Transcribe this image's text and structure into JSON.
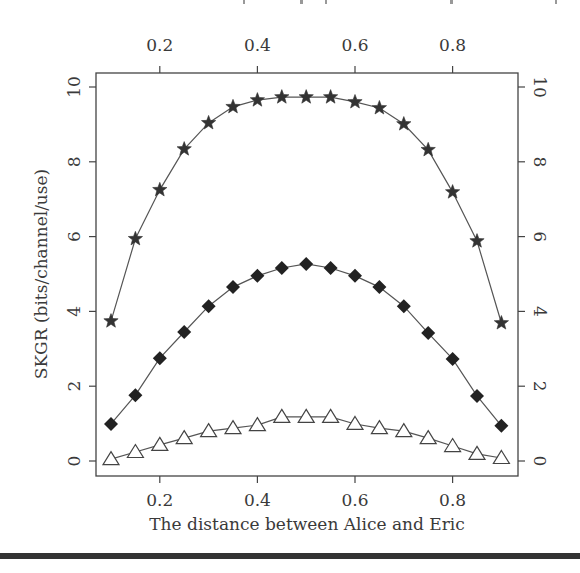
{
  "chart_data": {
    "type": "line",
    "title": "",
    "xlabel": "The distance between Alice and Eric",
    "ylabel": "SKGR (bits/channel/use)",
    "xlim": [
      0.08,
      0.94
    ],
    "ylim": [
      -0.4,
      10.4
    ],
    "x_ticks": [
      0.2,
      0.4,
      0.6,
      0.8
    ],
    "x_tick_labels": [
      "0.2",
      "0.4",
      "0.6",
      "0.8"
    ],
    "y_ticks": [
      0,
      2,
      4,
      6,
      8,
      10
    ],
    "y_tick_labels": [
      "0",
      "2",
      "4",
      "6",
      "8",
      "10"
    ],
    "secondary_axes": {
      "top_x": true,
      "right_y": true
    },
    "grid": false,
    "legend": null,
    "x": [
      0.1,
      0.15,
      0.2,
      0.25,
      0.3,
      0.35,
      0.4,
      0.45,
      0.5,
      0.55,
      0.6,
      0.65,
      0.7,
      0.75,
      0.8,
      0.85,
      0.9
    ],
    "series": [
      {
        "name": "star-series",
        "marker": "star",
        "values": [
          3.74,
          5.94,
          7.25,
          8.34,
          9.04,
          9.47,
          9.65,
          9.73,
          9.73,
          9.73,
          9.6,
          9.44,
          9.01,
          8.32,
          7.19,
          5.88,
          3.69
        ]
      },
      {
        "name": "filled-diamond-series",
        "marker": "diamond-filled",
        "values": [
          0.99,
          1.76,
          2.75,
          3.45,
          4.14,
          4.65,
          4.95,
          5.16,
          5.27,
          5.16,
          4.95,
          4.65,
          4.14,
          3.42,
          2.73,
          1.74,
          0.94
        ]
      },
      {
        "name": "open-triangle-series",
        "marker": "triangle-open",
        "values": [
          0.05,
          0.24,
          0.43,
          0.61,
          0.8,
          0.88,
          0.96,
          1.18,
          1.18,
          1.18,
          0.99,
          0.88,
          0.8,
          0.61,
          0.4,
          0.19,
          0.08
        ]
      }
    ]
  },
  "colors": {
    "ink": "#333333",
    "background": "#ffffff"
  }
}
